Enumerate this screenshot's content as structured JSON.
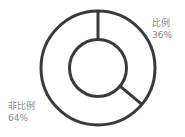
{
  "chart_data": {
    "type": "pie",
    "variant": "donut",
    "title": "",
    "categories": [
      "比例",
      "非比例"
    ],
    "values": [
      36,
      64
    ],
    "unit": "%",
    "labels": [
      {
        "name": "比例",
        "value": "36%"
      },
      {
        "name": "非比例",
        "value": "64%"
      }
    ],
    "start_angle_deg": 0,
    "direction": "clockwise",
    "legend": "none",
    "colors": {
      "stroke": "#3a3a3a",
      "fill": "#ffffff",
      "label": "#8a8a8a"
    }
  }
}
